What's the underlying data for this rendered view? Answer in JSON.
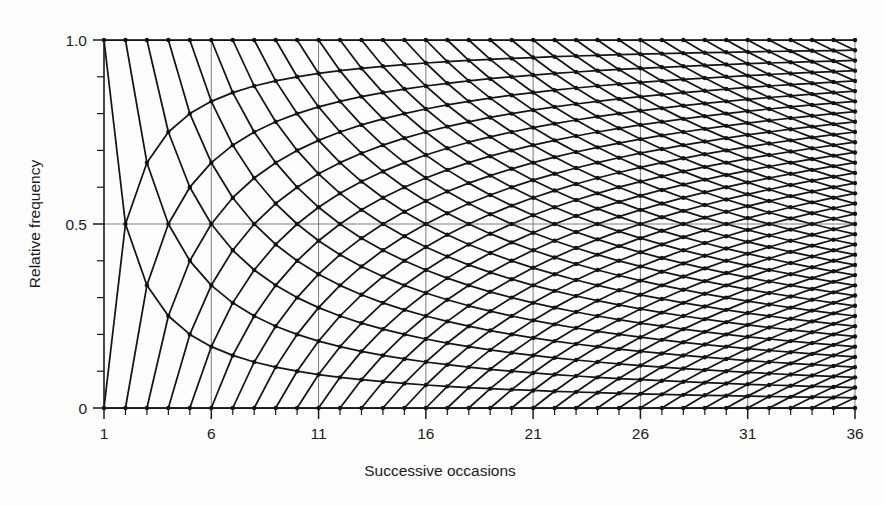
{
  "chart_data": {
    "type": "line",
    "title": "",
    "subtitle": "",
    "xlabel": "Successive occasions",
    "ylabel": "Relative frequency",
    "xlim": [
      1,
      36
    ],
    "ylim": [
      0,
      1.0
    ],
    "grid": true,
    "legend_position": "none",
    "x_ticks_major": [
      1,
      6,
      11,
      16,
      21,
      26,
      31,
      36
    ],
    "x_tick_labels": [
      "1",
      "6",
      "11",
      "16",
      "21",
      "26",
      "31",
      "36"
    ],
    "x_ticks_minor_step": 1,
    "y_ticks_major": [
      0,
      0.5,
      1.0
    ],
    "y_tick_labels": [
      "0",
      "0.5",
      "1.0"
    ],
    "y_ticks_minor": [
      0.1,
      0.2,
      0.3,
      0.4,
      0.6,
      0.7,
      0.8,
      0.9
    ],
    "gridlines_x": [
      6,
      11,
      16,
      21,
      26,
      31,
      36
    ],
    "gridlines_y": [
      0.5,
      1.0
    ],
    "n_min": 1,
    "n_max": 36,
    "series": [
      {
        "name": "constant-successes-k",
        "formula": "y = k / n",
        "k_range": [
          0,
          36
        ],
        "count": 37
      },
      {
        "name": "constant-failures-m",
        "formula": "y = (n - m) / n",
        "m_range": [
          0,
          36
        ],
        "count": 37
      }
    ],
    "endpoints": {
      "top_row": "y = 1.0 at every n (k = n, m = 0)",
      "bottom_row": "y = 0 at every n (k = 0, m = n)",
      "origin_fan": "all curves emanate from n = 1 at y = 0 or y = 1"
    },
    "colors": {
      "curve": "#141414",
      "node": "#121212",
      "axis": "#1a1a1a",
      "grid": "#6f6f6f",
      "background": "#fdfdfd",
      "text": "#1c1c1c"
    }
  },
  "axes": {
    "x_title": "Successive occasions",
    "y_title": "Relative frequency"
  }
}
